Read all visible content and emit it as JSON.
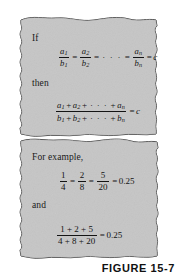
{
  "figure": {
    "caption": "FIGURE 15-7",
    "panel_fill_color": "#c6c6c6",
    "panel_edge_color": "#1b1b1b",
    "background_color": "#ffffff",
    "text_color": "#141414"
  },
  "panels": [
    {
      "name": "statement-panel",
      "labels": {
        "if": "If",
        "then": "then"
      },
      "equations": [
        {
          "name": "ratio-chain-equation",
          "plain": "a1/b1 = a2/b2 = ... = an/bn = c",
          "parts": {
            "f1_num": "a",
            "f1_num_sub": "1",
            "f1_den": "b",
            "f1_den_sub": "1",
            "eq1": "=",
            "f2_num": "a",
            "f2_num_sub": "2",
            "f2_den": "b",
            "f2_den_sub": "2",
            "eq2": "=",
            "dots": "· · ·",
            "eq3": "=",
            "f3_num": "a",
            "f3_num_sub": "n",
            "f3_den": "b",
            "f3_den_sub": "n",
            "eq4": "=",
            "rhs": "c"
          }
        },
        {
          "name": "sum-ratio-equation",
          "plain": "(a1 + a2 + ... + an) / (b1 + b2 + ... + bn) = c",
          "parts": {
            "num_a1": "a",
            "num_a1_sub": "1",
            "num_plus1": "+",
            "num_a2": "a",
            "num_a2_sub": "2",
            "num_plus2": "+",
            "num_dots": "· · ·",
            "num_plus3": "+",
            "num_an": "a",
            "num_an_sub": "n",
            "den_b1": "b",
            "den_b1_sub": "1",
            "den_plus1": "+",
            "den_b2": "b",
            "den_b2_sub": "2",
            "den_plus2": "+",
            "den_dots": "· · ·",
            "den_plus3": "+",
            "den_bn": "b",
            "den_bn_sub": "n",
            "eq": "=",
            "rhs": "c"
          }
        }
      ]
    },
    {
      "name": "example-panel",
      "labels": {
        "for_example": "For example,",
        "and": "and"
      },
      "equations": [
        {
          "name": "example-ratio-chain-equation",
          "plain": "1/4 = 2/8 = 5/20 = 0.25",
          "parts": {
            "f1_num": "1",
            "f1_den": "4",
            "eq1": "=",
            "f2_num": "2",
            "f2_den": "8",
            "eq2": "=",
            "f3_num": "5",
            "f3_den": "20",
            "eq3": "=",
            "rhs": "0.25"
          }
        },
        {
          "name": "example-sum-ratio-equation",
          "plain": "(1 + 2 + 5)/(4 + 8 + 20) = 0.25",
          "parts": {
            "num": "1 + 2 + 5",
            "den": "4 + 8 + 20",
            "eq": "=",
            "rhs": "0.25"
          }
        }
      ]
    }
  ]
}
